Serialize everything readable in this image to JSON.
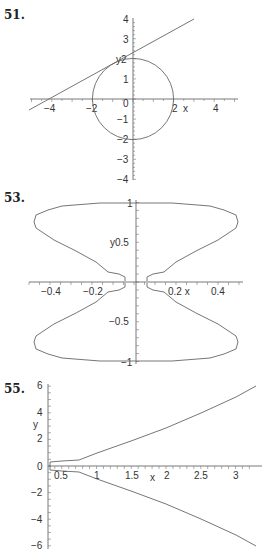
{
  "problems": [
    {
      "number": "51."
    },
    {
      "number": "53."
    },
    {
      "number": "55."
    }
  ],
  "chart_data": [
    {
      "type": "line",
      "problem": "51.",
      "title": "",
      "xlabel": "x",
      "ylabel": "y",
      "xlim": [
        -5,
        5
      ],
      "ylim": [
        -4,
        4
      ],
      "xticks": [
        -4,
        -2,
        2,
        4
      ],
      "yticks": [
        -4,
        -3,
        -2,
        -1,
        0,
        1,
        2,
        3,
        4
      ],
      "series": [
        {
          "name": "circle",
          "description": "x^2 + y^2 = 4",
          "radius": 2,
          "center": [
            0,
            0
          ]
        },
        {
          "name": "tangent line",
          "x": [
            -5.1,
            -4,
            0,
            3
          ],
          "y": [
            -0.6,
            0,
            2.3,
            4
          ]
        }
      ]
    },
    {
      "type": "line",
      "problem": "53.",
      "title": "",
      "xlabel": "x",
      "ylabel": "y",
      "xlim": [
        -0.5,
        0.5
      ],
      "ylim": [
        -1,
        1
      ],
      "xticks": [
        -0.4,
        -0.2,
        0.2,
        0.4
      ],
      "yticks": [
        -1,
        -0.5,
        0.5,
        1
      ],
      "series": [
        {
          "name": "closed curve (upper lobe)",
          "x": [
            0.03,
            0.03,
            0.1,
            0.25,
            0.4,
            0.48,
            0.5,
            0.48,
            0.4,
            0.25,
            0.0
          ],
          "y": [
            0.0,
            0.08,
            0.12,
            0.3,
            0.5,
            0.66,
            0.74,
            0.82,
            0.92,
            0.98,
            1.0
          ]
        },
        {
          "name": "closed curve (lower lobe)",
          "x": [
            0.03,
            0.03,
            0.1,
            0.25,
            0.4,
            0.48,
            0.5,
            0.48,
            0.4,
            0.25,
            0.0
          ],
          "y": [
            0.0,
            -0.08,
            -0.12,
            -0.3,
            -0.5,
            -0.66,
            -0.74,
            -0.82,
            -0.92,
            -0.98,
            -1.0
          ]
        }
      ]
    },
    {
      "type": "line",
      "problem": "55.",
      "title": "",
      "xlabel": "x",
      "ylabel": "y",
      "xlim": [
        0.3,
        3.3
      ],
      "ylim": [
        -6,
        6
      ],
      "xticks": [
        0.5,
        1,
        1.5,
        2,
        2.5,
        3
      ],
      "yticks": [
        -6,
        -4,
        -2,
        0,
        2,
        4,
        6
      ],
      "series": [
        {
          "name": "upper branch",
          "x": [
            0.33,
            0.5,
            1,
            1.5,
            2,
            2.5,
            3,
            3.3
          ],
          "y": [
            0.3,
            0.4,
            1.0,
            1.84,
            2.83,
            3.95,
            5.2,
            6.0
          ]
        },
        {
          "name": "lower branch",
          "x": [
            0.33,
            0.5,
            1,
            1.5,
            2,
            2.5,
            3,
            3.3
          ],
          "y": [
            -0.3,
            -0.4,
            -1.0,
            -1.84,
            -2.83,
            -3.95,
            -5.2,
            -6.0
          ]
        }
      ]
    }
  ]
}
